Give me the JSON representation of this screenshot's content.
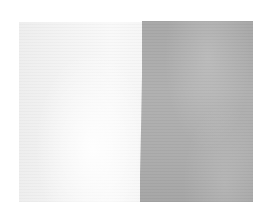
{
  "image": {
    "subject": "two-tone fabric swatch",
    "background_color": "#ffffff",
    "panels": [
      {
        "name": "light-panel",
        "color": "#f4f4f4"
      },
      {
        "name": "gray-panel",
        "color": "#adadad"
      }
    ]
  }
}
